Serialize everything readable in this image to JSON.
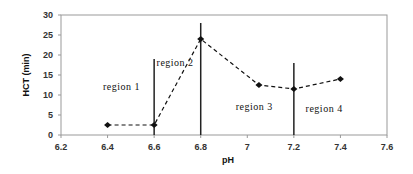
{
  "chart_data": {
    "type": "line",
    "title": "",
    "xlabel": "pH",
    "ylabel": "HCT (min)",
    "xlim": [
      6.2,
      7.6
    ],
    "ylim": [
      0,
      30
    ],
    "x_ticks": [
      "6.2",
      "6.4",
      "6.6",
      "6.8",
      "7",
      "7.2",
      "7.4",
      "7.6"
    ],
    "y_ticks": [
      "0",
      "5",
      "10",
      "15",
      "20",
      "25",
      "30"
    ],
    "grid": false,
    "legend": null,
    "series": [
      {
        "name": "HCT",
        "style": "dashed line with diamond markers",
        "x": [
          6.4,
          6.6,
          6.8,
          7.05,
          7.2,
          7.4
        ],
        "y": [
          2.5,
          2.5,
          24,
          12.5,
          11.5,
          14
        ]
      }
    ],
    "vertical_lines": [
      {
        "x": 6.6,
        "y_top": 19
      },
      {
        "x": 6.8,
        "y_top": 28
      },
      {
        "x": 7.2,
        "y_top": 18
      }
    ],
    "annotations": [
      {
        "text": "region 1",
        "x": 6.46,
        "y": 12
      },
      {
        "text": "region 2",
        "x": 6.69,
        "y": 18
      },
      {
        "text": "region 3",
        "x": 7.03,
        "y": 7
      },
      {
        "text": "region 4",
        "x": 7.33,
        "y": 6.5
      }
    ]
  }
}
